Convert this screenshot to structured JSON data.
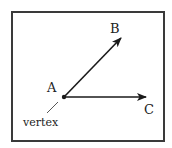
{
  "diagram": {
    "type": "angle",
    "frame": {
      "stroke": "#3a3a3a"
    },
    "points": {
      "A": {
        "label": "A",
        "x": 64,
        "y": 97,
        "label_x": 47,
        "label_y": 92
      },
      "B": {
        "label": "B",
        "x": 122,
        "y": 37,
        "label_x": 110,
        "label_y": 33
      },
      "C": {
        "label": "C",
        "x": 147,
        "y": 97,
        "label_x": 144,
        "label_y": 114
      }
    },
    "rays": [
      {
        "name": "ray-AB",
        "from": "A",
        "to": "B"
      },
      {
        "name": "ray-AC",
        "from": "A",
        "to": "C"
      }
    ],
    "annotation": {
      "text": "vertex",
      "x": 23,
      "y": 126,
      "pointer": {
        "x1": 47,
        "y1": 113,
        "x2": 58,
        "y2": 102
      }
    },
    "colors": {
      "line": "#1a1a1a",
      "text": "#222222"
    }
  }
}
